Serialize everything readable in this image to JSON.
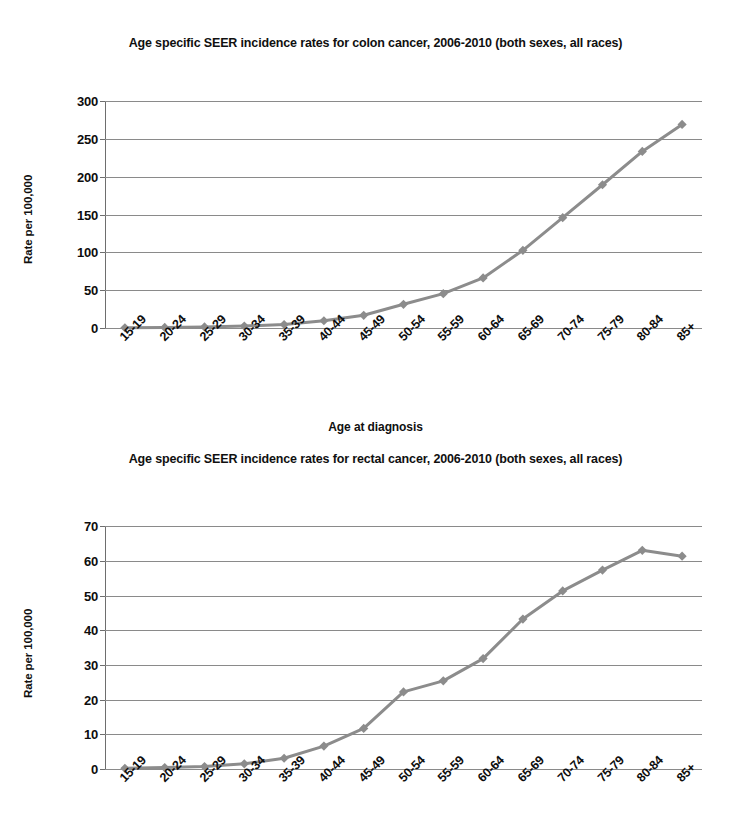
{
  "document": {
    "kind": "figure-page",
    "background": "#ffffff"
  },
  "style": {
    "line_color": "#8c8c8c",
    "marker_color": "#8c8c8c",
    "grid_color": "#8a8a8a",
    "axis_color": "#6e6e6e",
    "text_color": "#101010"
  },
  "charts": [
    {
      "id": "colon",
      "title": "Age specific SEER incidence rates for colon cancer, 2006-2010 (both sexes, all races)",
      "ylabel": "Rate per 100,000",
      "xlabel": "Age at diagnosis",
      "ytick_labels": [
        "300",
        "250",
        "200",
        "150",
        "100",
        "50",
        "0"
      ]
    },
    {
      "id": "rectal",
      "title": "Age specific SEER incidence rates for rectal cancer, 2006-2010 (both sexes, all races)",
      "ylabel": "Rate per 100,000",
      "xlabel": "",
      "ytick_labels": [
        "70",
        "60",
        "50",
        "40",
        "30",
        "20",
        "10",
        "0"
      ]
    }
  ],
  "chart_data": [
    {
      "type": "line",
      "id": "colon",
      "title": "Age specific SEER incidence rates for colon cancer, 2006-2010 (both sexes, all races)",
      "xlabel": "Age at diagnosis",
      "ylabel": "Rate per 100,000",
      "categories": [
        "15-19",
        "20-24",
        "25-29",
        "30-34",
        "35-39",
        "40-44",
        "45-49",
        "50-54",
        "55-59",
        "60-64",
        "65-69",
        "70-74",
        "75-79",
        "80-84",
        "85+"
      ],
      "values": [
        0.3,
        0.7,
        1.4,
        2.6,
        4.6,
        9.6,
        16.8,
        31.3,
        45.4,
        66.2,
        102.7,
        145.8,
        189.3,
        233.4,
        269.0
      ],
      "ylim": [
        0,
        300
      ],
      "yticks": [
        0,
        50,
        100,
        150,
        200,
        250,
        300
      ],
      "grid": true,
      "legend": false,
      "marker": "diamond"
    },
    {
      "type": "line",
      "id": "rectal",
      "title": "Age specific SEER incidence rates for rectal cancer, 2006-2010 (both sexes, all races)",
      "xlabel": "",
      "ylabel": "Rate per 100,000",
      "categories": [
        "15-19",
        "20-24",
        "25-29",
        "30-34",
        "35-39",
        "40-44",
        "45-49",
        "50-54",
        "55-59",
        "60-64",
        "65-69",
        "70-74",
        "75-79",
        "80-84",
        "85+"
      ],
      "values": [
        0.2,
        0.4,
        0.7,
        1.5,
        3.1,
        6.6,
        11.7,
        22.2,
        25.4,
        31.8,
        43.2,
        51.3,
        57.3,
        63.0,
        61.3
      ],
      "ylim": [
        0,
        70
      ],
      "yticks": [
        0,
        10,
        20,
        30,
        40,
        50,
        60,
        70
      ],
      "grid": true,
      "legend": false,
      "marker": "diamond"
    }
  ]
}
